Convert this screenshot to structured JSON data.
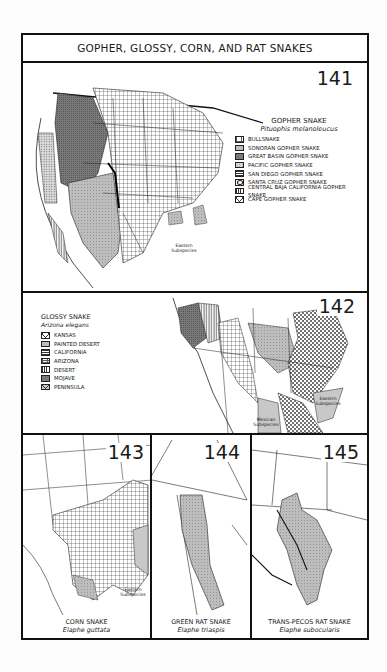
{
  "page": {
    "title": "GOPHER, GLOSSY, CORN, AND RAT SNAKES"
  },
  "map141": {
    "number": "141",
    "species_common": "GOPHER SNAKE",
    "species_scientific": "Pituophis melanoleucus",
    "legend": [
      {
        "label": "BULLSNAKE",
        "pattern": "open-crosshatch"
      },
      {
        "label": "SONORAN GOPHER SNAKE",
        "pattern": "light-stipple"
      },
      {
        "label": "GREAT BASIN GOPHER SNAKE",
        "pattern": "dark-stipple"
      },
      {
        "label": "PACIFIC GOPHER SNAKE",
        "pattern": "dots"
      },
      {
        "label": "SAN DIEGO GOPHER SNAKE",
        "pattern": "horizontal-lines"
      },
      {
        "label": "SANTA CRUZ GOPHER SNAKE",
        "pattern": "oval"
      },
      {
        "label": "CENTRAL BAJA CALIFORNIA GOPHER SNAKE",
        "pattern": "vertical-lines"
      },
      {
        "label": "CAPE GOPHER SNAKE",
        "pattern": "diamond-hatch"
      }
    ],
    "annotation": "Eastern Subspecies"
  },
  "map142": {
    "number": "142",
    "species_common": "GLOSSY SNAKE",
    "species_scientific": "Arizona elegans",
    "legend": [
      {
        "label": "KANSAS",
        "pattern": "diamond-hatch"
      },
      {
        "label": "PAINTED DESERT",
        "pattern": "light-stipple"
      },
      {
        "label": "CALIFORNIA",
        "pattern": "horizontal-lines"
      },
      {
        "label": "ARIZONA",
        "pattern": "open-crosshatch"
      },
      {
        "label": "DESERT",
        "pattern": "vertical-lines"
      },
      {
        "label": "MOJAVE",
        "pattern": "dark-stipple"
      },
      {
        "label": "PENINSULA",
        "pattern": "diamond-hatch"
      }
    ],
    "annotations": [
      "Eastern Subspecies",
      "Mexican Subspecies",
      "?"
    ]
  },
  "map143": {
    "number": "143",
    "species_common": "CORN SNAKE",
    "species_scientific": "Elaphe guttata",
    "annotation": "Eastern Subspecies"
  },
  "map144": {
    "number": "144",
    "species_common": "GREEN RAT SNAKE",
    "species_scientific": "Elaphe triaspis"
  },
  "map145": {
    "number": "145",
    "species_common": "TRANS-PECOS RAT SNAKE",
    "species_scientific": "Elaphe subocularis"
  },
  "colors": {
    "ink": "#111111",
    "range_fill_light": "#c8c8c8",
    "range_fill_dark": "#8a8a8a",
    "paper": "#ffffff"
  }
}
